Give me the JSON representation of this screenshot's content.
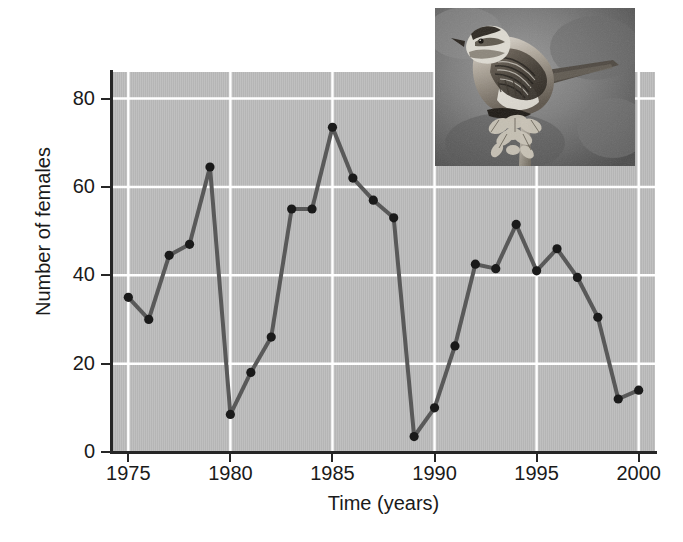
{
  "figure": {
    "background_color": "#ffffff",
    "plot_background_color": "#b9b9b9",
    "line_color": "#595959",
    "marker_color": "#1a1a1a",
    "gridline_color": "#ffffff",
    "axis_color": "#262626"
  },
  "axes": {
    "x_title": "Time (years)",
    "y_title": "Number of females",
    "x_tick_labels": [
      "1975",
      "1980",
      "1985",
      "1990",
      "1995",
      "2000"
    ],
    "y_tick_labels": [
      "0",
      "20",
      "40",
      "60",
      "80"
    ]
  },
  "inset": {
    "name": "sparrow-photograph",
    "description": "Black and white photograph of a song sparrow perched on a plant stalk",
    "alt_text": "song sparrow perched on dried plant"
  },
  "chart_data": {
    "type": "line",
    "title": "",
    "xlabel": "Time (years)",
    "ylabel": "Number of females",
    "xlim": [
      1974.2,
      2000.8
    ],
    "ylim": [
      0,
      86
    ],
    "grid": true,
    "grid_axes": "both",
    "x_ticks": [
      1975,
      1980,
      1985,
      1990,
      1995,
      2000
    ],
    "y_ticks": [
      0,
      20,
      40,
      60,
      80
    ],
    "legend": null,
    "markers": "filled-circle",
    "series": [
      {
        "name": "Number of females",
        "x": [
          1975,
          1976,
          1977,
          1978,
          1979,
          1980,
          1981,
          1982,
          1983,
          1984,
          1985,
          1986,
          1987,
          1988,
          1989,
          1990,
          1991,
          1992,
          1993,
          1994,
          1995,
          1996,
          1997,
          1998,
          1999,
          2000
        ],
        "values": [
          35,
          30,
          44.5,
          47,
          64.5,
          8.5,
          18,
          26,
          55,
          55,
          73.5,
          62,
          57,
          53,
          3.5,
          10,
          24,
          42.5,
          41.5,
          51.5,
          41,
          46,
          39.5,
          30.5,
          12,
          14
        ]
      }
    ]
  }
}
